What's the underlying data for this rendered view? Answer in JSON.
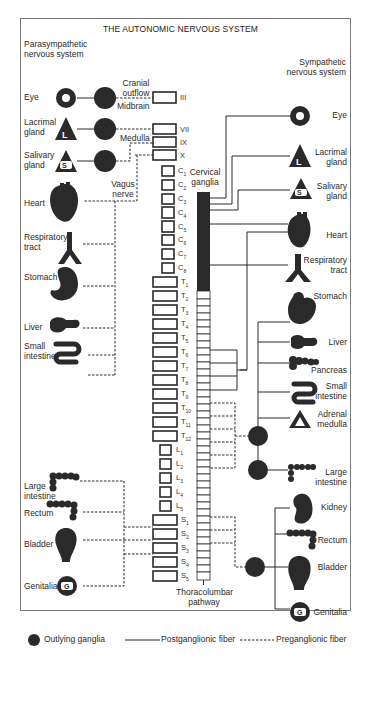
{
  "title": "THE AUTONOMIC NERVOUS SYSTEM",
  "parasympathetic": {
    "heading": [
      "Parasympathetic",
      "nervous system"
    ],
    "organs": [
      {
        "name": "Eye",
        "icon": "eye-ring-icon"
      },
      {
        "name": "Lacrimal gland",
        "icon": "lacrimal-triangle-L-icon"
      },
      {
        "name": "Salivary gland",
        "icon": "salivary-triangle-S-icon"
      },
      {
        "name": "Heart",
        "icon": "heart-icon"
      },
      {
        "name": "Respiratory tract",
        "icon": "respiratory-tract-icon"
      },
      {
        "name": "Stomach",
        "icon": "stomach-icon"
      },
      {
        "name": "Liver",
        "icon": "liver-icon"
      },
      {
        "name": "Small intestine",
        "icon": "small-intestine-icon"
      },
      {
        "name": "Large intestine",
        "icon": "large-intestine-icon"
      },
      {
        "name": "Rectum",
        "icon": "rectum-icon"
      },
      {
        "name": "Bladder",
        "icon": "bladder-icon"
      },
      {
        "name": "Genitalia",
        "icon": "genitalia-G-icon"
      }
    ],
    "annotations": {
      "cranial_outflow": "Cranial outflow",
      "midbrain": "Midbrain",
      "medulla": "Medulla",
      "vagus_nerve": "Vagus nerve"
    }
  },
  "sympathetic": {
    "heading": [
      "Sympathetic",
      "nervous system"
    ],
    "organs": [
      {
        "name": "Eye",
        "icon": "eye-ring-icon"
      },
      {
        "name": "Lacrimal gland",
        "icon": "lacrimal-triangle-L-icon"
      },
      {
        "name": "Salivary gland",
        "icon": "salivary-triangle-S-icon"
      },
      {
        "name": "Heart",
        "icon": "heart-icon"
      },
      {
        "name": "Respiratory tract",
        "icon": "respiratory-tract-icon"
      },
      {
        "name": "Stomach",
        "icon": "stomach-icon"
      },
      {
        "name": "Liver",
        "icon": "liver-icon"
      },
      {
        "name": "Pancreas",
        "icon": "pancreas-icon"
      },
      {
        "name": "Small intestine",
        "icon": "small-intestine-icon"
      },
      {
        "name": "Adrenal medulla",
        "icon": "adrenal-triangle-icon"
      },
      {
        "name": "Large intestine",
        "icon": "large-intestine-icon"
      },
      {
        "name": "Kidney",
        "icon": "kidney-icon"
      },
      {
        "name": "Rectum",
        "icon": "rectum-icon"
      },
      {
        "name": "Bladder",
        "icon": "bladder-icon"
      },
      {
        "name": "Genitalia",
        "icon": "genitalia-G-icon"
      }
    ],
    "annotations": {
      "cervical_ganglia": "Cervical ganglia",
      "thoracolumbar": "Thoracolumbar pathway"
    }
  },
  "cranial_nerves": [
    "III",
    "VII",
    "IX",
    "X"
  ],
  "spinal_segments": {
    "cervical": [
      "C1",
      "C2",
      "C3",
      "C4",
      "C5",
      "C6",
      "C7",
      "C8"
    ],
    "thoracic": [
      "T1",
      "T2",
      "T3",
      "T4",
      "T5",
      "T6",
      "T7",
      "T8",
      "T9",
      "T10",
      "T11",
      "T12"
    ],
    "lumbar": [
      "L1",
      "L2",
      "L3",
      "L4",
      "L5"
    ],
    "sacral": [
      "S1",
      "S2",
      "S3",
      "S4",
      "S5"
    ]
  },
  "legend": {
    "ganglia": "Outlying ganglia",
    "post": "Postganglionic fiber",
    "pre": "Preganglionic fiber"
  },
  "colors": {
    "ink": "#2a2a2a",
    "frame": "#7a7a7a",
    "background": "#ffffff"
  }
}
